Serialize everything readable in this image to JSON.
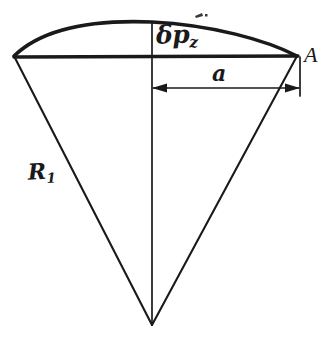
{
  "figure": {
    "type": "technical-line-diagram",
    "background_color": "#ffffff",
    "stroke_color": "#1a1a1a",
    "labels": {
      "arc_deflection": {
        "base": "δp",
        "subscript": "z"
      },
      "vertex_point": "A",
      "chord_half_width": "a",
      "radius": {
        "base": "R",
        "subscript": "1"
      }
    },
    "geometry": {
      "apex": {
        "x": 152,
        "y": 325
      },
      "chord_left": {
        "x": 14,
        "y": 56
      },
      "chord_right": {
        "x": 297,
        "y": 56
      },
      "arc_peak": {
        "x": 150,
        "y": 22
      },
      "center_line_x": 152,
      "dimension_line_y": 88,
      "dimension_line_from_x": 152,
      "dimension_line_to_x": 300,
      "extension_line_x": 300,
      "extension_line_top_y": 57,
      "extension_line_bottom_y": 96
    }
  }
}
